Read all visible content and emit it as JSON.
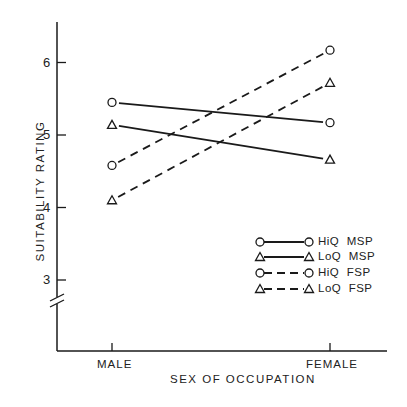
{
  "chart_data": {
    "type": "line",
    "title": "",
    "xlabel": "SEX OF OCCUPATION",
    "ylabel": "SUITABILITY RATING",
    "categories": [
      "MALE",
      "FEMALE"
    ],
    "yticks": [
      "3",
      "4",
      "5",
      "6"
    ],
    "ylim": [
      2.6,
      6.5
    ],
    "axis_break": true,
    "grid": false,
    "legend_position": "lower right",
    "series": [
      {
        "name": "HiQ MSP",
        "marker": "circle",
        "line": "solid",
        "values": [
          5.45,
          5.17
        ]
      },
      {
        "name": "LoQ MSP",
        "marker": "triangle",
        "line": "solid",
        "values": [
          5.14,
          4.66
        ]
      },
      {
        "name": "HiQ FSP",
        "marker": "circle",
        "line": "dashed",
        "values": [
          4.58,
          6.17
        ]
      },
      {
        "name": "LoQ FSP",
        "marker": "triangle",
        "line": "dashed",
        "values": [
          4.1,
          5.72
        ]
      }
    ]
  },
  "legend": {
    "items": [
      {
        "label": "HiQ  MSP"
      },
      {
        "label": "LoQ  MSP"
      },
      {
        "label": "HiQ  FSP"
      },
      {
        "label": "LoQ  FSP"
      }
    ]
  }
}
